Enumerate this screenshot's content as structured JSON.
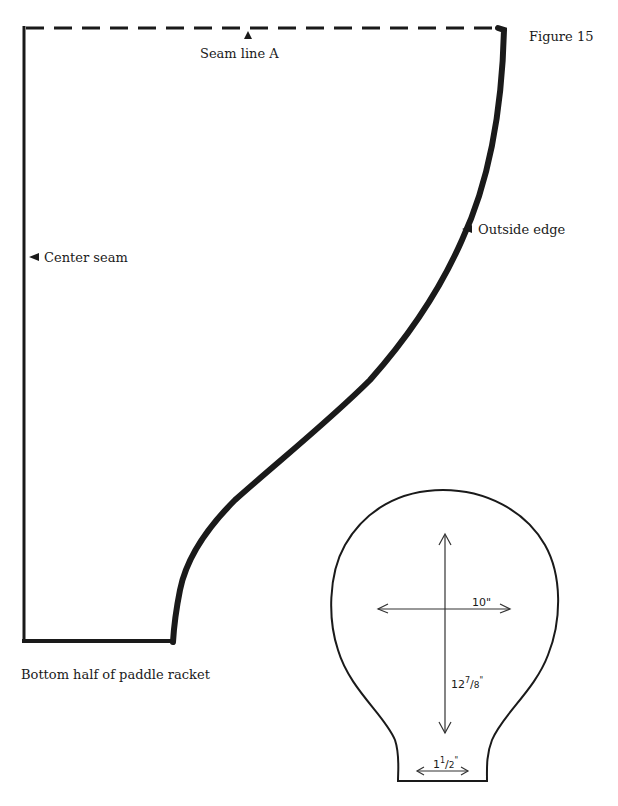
{
  "figure": {
    "number_label": "Figure 15"
  },
  "pattern_piece": {
    "caption": "Bottom half of paddle racket",
    "labels": {
      "seam_line": "Seam line A",
      "center_seam": "Center seam",
      "outside_edge": "Outside edge"
    },
    "marker_icons": {
      "seam_line": "up-triangle-marker",
      "center_seam": "left-triangle-marker",
      "outside_edge": "left-triangle-marker"
    }
  },
  "racket_diagram": {
    "width_label": "10\"",
    "height_label_whole": "12",
    "height_label_num": "7",
    "height_label_den": "8",
    "height_label_unit": "\"",
    "neck_label_whole": "1",
    "neck_label_num": "1",
    "neck_label_den": "2",
    "neck_label_unit": "\""
  },
  "colors": {
    "ink": "#1a1a1a",
    "paper": "#ffffff"
  }
}
